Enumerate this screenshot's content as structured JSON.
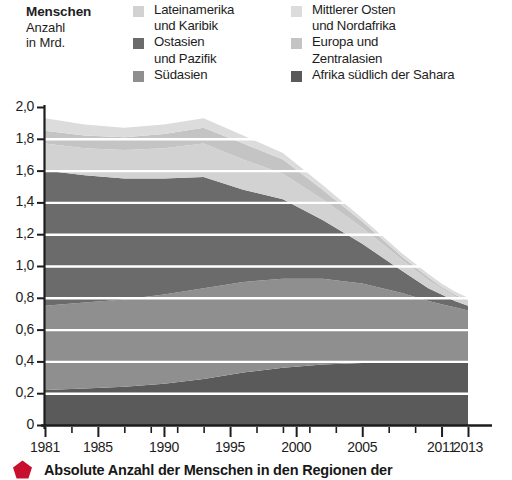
{
  "axis_title": {
    "line1": "Menschen",
    "line2": "Anzahl",
    "line3": "in Mrd."
  },
  "caption": {
    "text": "Absolute Anzahl der Menschen in den Regionen der",
    "bullet_icon": "pentagon-bullet-icon",
    "bullet_color": "#c8102e"
  },
  "colors": {
    "lateinamerika": "#d2d2d2",
    "ostasien": "#6b6b6b",
    "suedasien": "#8f8f8f",
    "mittlerer_osten": "#dcdcdc",
    "europa": "#c4c4c4",
    "afrika": "#5a5a5a",
    "gridline": "#ffffff",
    "axis": "#1d1d1d",
    "background": "#ffffff"
  },
  "legend": {
    "columns": [
      {
        "entries": [
          {
            "label": "Lateinamerika\nund Karibik",
            "swatch": "#d2d2d2",
            "swatch_icon": "legend-swatch-lateinamerika"
          },
          {
            "label": "Ostasien\nund Pazifik",
            "swatch": "#6b6b6b",
            "swatch_icon": "legend-swatch-ostasien"
          },
          {
            "label": "Südasien",
            "swatch": "#8f8f8f",
            "swatch_icon": "legend-swatch-suedasien"
          }
        ]
      },
      {
        "entries": [
          {
            "label": "Mittlerer Osten\nund Nordafrika",
            "swatch": "#dcdcdc",
            "swatch_icon": "legend-swatch-mittlerer-osten"
          },
          {
            "label": "Europa und\nZentralasien",
            "swatch": "#c4c4c4",
            "swatch_icon": "legend-swatch-europa"
          },
          {
            "label": "Afrika südlich der Sahara",
            "swatch": "#5a5a5a",
            "swatch_icon": "legend-swatch-afrika"
          }
        ]
      }
    ]
  },
  "chart_data": {
    "type": "area",
    "title": "",
    "subtitle": "",
    "xlabel": "",
    "ylabel": "Menschen Anzahl in Mrd.",
    "stacked": true,
    "grid": true,
    "legend_position": "top",
    "xlim": [
      1981,
      2013
    ],
    "ylim": [
      0,
      2.0
    ],
    "ytick_labels": [
      "2,0",
      "1,8",
      "1,6",
      "1,4",
      "1,2",
      "1,0",
      "0,8",
      "0,6",
      "0,4",
      "0,2",
      "0"
    ],
    "ytick_values": [
      2.0,
      1.8,
      1.6,
      1.4,
      1.2,
      1.0,
      0.8,
      0.6,
      0.4,
      0.2,
      0
    ],
    "xtick_labels": [
      "1981",
      "1985",
      "1990",
      "1995",
      "2000",
      "2005",
      "2011",
      "2013"
    ],
    "xtick_values": [
      1981,
      1985,
      1990,
      1995,
      2000,
      2005,
      2011,
      2013
    ],
    "x": [
      1981,
      1984,
      1987,
      1990,
      1993,
      1996,
      1999,
      2002,
      2005,
      2008,
      2010,
      2011,
      2012,
      2013
    ],
    "series": [
      {
        "name": "Afrika südlich der Sahara",
        "color": "#5a5a5a",
        "values": [
          0.22,
          0.23,
          0.24,
          0.26,
          0.29,
          0.33,
          0.36,
          0.38,
          0.39,
          0.4,
          0.4,
          0.4,
          0.4,
          0.4
        ]
      },
      {
        "name": "Südasien",
        "color": "#8f8f8f",
        "values": [
          0.53,
          0.54,
          0.55,
          0.56,
          0.57,
          0.57,
          0.56,
          0.54,
          0.5,
          0.43,
          0.38,
          0.36,
          0.34,
          0.32
        ]
      },
      {
        "name": "Ostasien und Pazifik",
        "color": "#6b6b6b",
        "values": [
          0.85,
          0.8,
          0.76,
          0.73,
          0.7,
          0.58,
          0.5,
          0.37,
          0.25,
          0.14,
          0.08,
          0.06,
          0.04,
          0.03
        ]
      },
      {
        "name": "Lateinamerika und Karibik",
        "color": "#d2d2d2",
        "values": [
          0.17,
          0.17,
          0.18,
          0.19,
          0.21,
          0.19,
          0.16,
          0.13,
          0.1,
          0.07,
          0.05,
          0.04,
          0.03,
          0.02
        ]
      },
      {
        "name": "Europa und Zentralasien",
        "color": "#c4c4c4",
        "values": [
          0.08,
          0.08,
          0.08,
          0.09,
          0.1,
          0.1,
          0.09,
          0.06,
          0.04,
          0.02,
          0.02,
          0.01,
          0.01,
          0.01
        ]
      },
      {
        "name": "Mittlerer Osten und Nordafrika",
        "color": "#dcdcdc",
        "values": [
          0.08,
          0.07,
          0.06,
          0.06,
          0.06,
          0.05,
          0.04,
          0.03,
          0.02,
          0.02,
          0.02,
          0.02,
          0.02,
          0.02
        ]
      }
    ],
    "totals": [
      1.93,
      1.89,
      1.87,
      1.89,
      1.93,
      1.82,
      1.71,
      1.51,
      1.3,
      1.08,
      0.95,
      0.89,
      0.84,
      0.8
    ]
  }
}
